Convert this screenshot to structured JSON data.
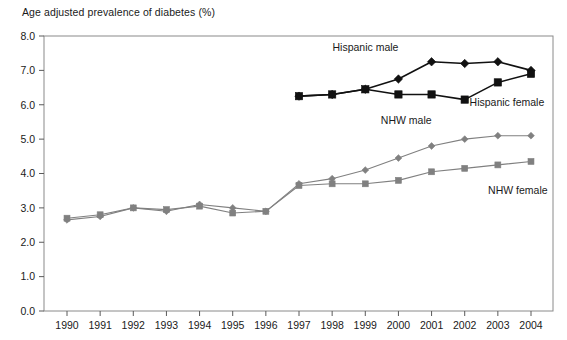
{
  "chart_data": {
    "type": "line",
    "title": "Age adjusted prevalence of diabetes (%)",
    "xlabel": "",
    "ylabel": "",
    "ylim": [
      0.0,
      8.0
    ],
    "ytick_labels": [
      "0.0",
      "1.0",
      "2.0",
      "3.0",
      "4.0",
      "5.0",
      "6.0",
      "7.0",
      "8.0"
    ],
    "ytick_values": [
      0.0,
      1.0,
      2.0,
      3.0,
      4.0,
      5.0,
      6.0,
      7.0,
      8.0
    ],
    "grid": false,
    "legend_position": "inline-annotations",
    "categories": [
      "1990",
      "1991",
      "1992",
      "1993",
      "1994",
      "1995",
      "1996",
      "1997",
      "1998",
      "1999",
      "2000",
      "2001",
      "2002",
      "2003",
      "2004"
    ],
    "x": [
      1990,
      1991,
      1992,
      1993,
      1994,
      1995,
      1996,
      1997,
      1998,
      1999,
      2000,
      2001,
      2002,
      2003,
      2004
    ],
    "series": [
      {
        "name": "Hispanic male",
        "marker": "diamond",
        "color": "#111111",
        "x": [
          1997,
          1998,
          1999,
          2000,
          2001,
          2002,
          2003,
          2004
        ],
        "values": [
          6.25,
          6.3,
          6.45,
          6.75,
          7.25,
          7.2,
          7.25,
          7.0
        ]
      },
      {
        "name": "Hispanic female",
        "marker": "square",
        "color": "#111111",
        "x": [
          1997,
          1998,
          1999,
          2000,
          2001,
          2002,
          2003,
          2004
        ],
        "values": [
          6.25,
          6.3,
          6.45,
          6.3,
          6.3,
          6.15,
          6.65,
          6.9
        ]
      },
      {
        "name": "NHW male",
        "marker": "diamond",
        "color": "#808080",
        "x": [
          1990,
          1991,
          1992,
          1993,
          1994,
          1995,
          1996,
          1997,
          1998,
          1999,
          2000,
          2001,
          2002,
          2003,
          2004
        ],
        "values": [
          2.65,
          2.75,
          3.0,
          2.9,
          3.1,
          3.0,
          2.9,
          3.7,
          3.85,
          4.1,
          4.45,
          4.8,
          5.0,
          5.1,
          5.1
        ]
      },
      {
        "name": "NHW female",
        "marker": "square",
        "color": "#808080",
        "x": [
          1990,
          1991,
          1992,
          1993,
          1994,
          1995,
          1996,
          1997,
          1998,
          1999,
          2000,
          2001,
          2002,
          2003,
          2004
        ],
        "values": [
          2.7,
          2.8,
          3.0,
          2.95,
          3.05,
          2.85,
          2.9,
          3.65,
          3.7,
          3.7,
          3.8,
          4.05,
          4.15,
          4.25,
          4.35
        ]
      }
    ],
    "annotations": [
      {
        "text": "Hispanic male",
        "x": 2000.0,
        "y": 7.55,
        "anchor": "end"
      },
      {
        "text": "Hispanic female",
        "x": 2004.4,
        "y": 5.95,
        "anchor": "end"
      },
      {
        "text": "NHW male",
        "x": 2001.0,
        "y": 5.45,
        "anchor": "end"
      },
      {
        "text": "NHW female",
        "x": 2004.5,
        "y": 3.4,
        "anchor": "end"
      }
    ]
  }
}
